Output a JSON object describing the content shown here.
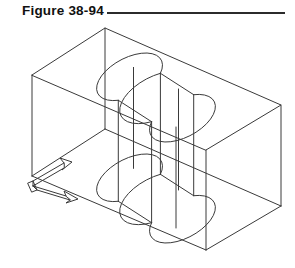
{
  "figure": {
    "caption": "Figure 38-94",
    "rule_color": "#2b2b2b"
  },
  "drawing": {
    "title": "Isometric wireframe of rectangular block with S-shaped through slot",
    "projection": "isometric",
    "line_color": "#3a3a3a",
    "background": "#ffffff",
    "line_width": 1,
    "ucs_icon": {
      "name": "ucs-coordinate-icon",
      "axes": [
        "X",
        "Y"
      ],
      "origin_x": 33,
      "origin_y": 181
    },
    "geometry": {
      "box": {
        "top_left": [
          32,
          75
        ],
        "top_back": [
          105,
          28
        ],
        "top_right": [
          281,
          105
        ],
        "top_front": [
          206,
          150
        ],
        "bottom_left": [
          32,
          176
        ],
        "bottom_right": [
          281,
          206
        ],
        "bottom_front": [
          206,
          250
        ],
        "height": 101
      },
      "slot": {
        "type": "obround-double-cylinder",
        "ellipse_rx": 36,
        "ellipse_ry": 19,
        "top_hole_a_center": [
          136,
          86
        ],
        "top_hole_b_center": [
          176,
          108
        ],
        "bottom_hole_a_center": [
          136,
          187
        ],
        "bottom_hole_b_center": [
          176,
          209
        ]
      }
    }
  }
}
